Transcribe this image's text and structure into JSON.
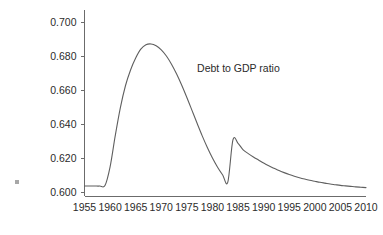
{
  "chart_data": {
    "type": "line",
    "title": "",
    "subtitle": "",
    "xlabel": "",
    "ylabel": "",
    "xlim": [
      1955,
      2010
    ],
    "ylim": [
      0.6,
      0.7
    ],
    "grid": false,
    "legend_position": "none",
    "annotations": [
      {
        "text": "Debt to GDP ratio",
        "x": 1977,
        "y": 0.6705
      }
    ],
    "x_tick_labels": [
      "1955",
      "1960",
      "1965",
      "1970",
      "1975",
      "1980",
      "1985",
      "1990",
      "1995",
      "2000",
      "2005",
      "2010"
    ],
    "x_ticks": [
      1955,
      1960,
      1965,
      1970,
      1975,
      1980,
      1985,
      1990,
      1995,
      2000,
      2005,
      2010
    ],
    "y_tick_labels": [
      "0.600",
      "0.620",
      "0.640",
      "0.660",
      "0.680",
      "0.700"
    ],
    "y_ticks": [
      0.6,
      0.62,
      0.64,
      0.66,
      0.68,
      0.7
    ],
    "series": [
      {
        "name": "Debt to GDP ratio",
        "color": "#5f5f5f",
        "x": [
          1955,
          1956,
          1957,
          1958,
          1959,
          1960,
          1961,
          1962,
          1963,
          1964,
          1965,
          1966,
          1967,
          1968,
          1969,
          1970,
          1971,
          1972,
          1973,
          1974,
          1975,
          1976,
          1977,
          1978,
          1979,
          1980,
          1981,
          1982,
          1983,
          1984,
          1985,
          1986,
          1987,
          1988,
          1989,
          1990,
          1991,
          1992,
          1993,
          1994,
          1995,
          1996,
          1997,
          1998,
          1999,
          2000,
          2001,
          2002,
          2003,
          2004,
          2005,
          2006,
          2007,
          2008,
          2009,
          2010
        ],
        "y": [
          0.6035,
          0.6035,
          0.6035,
          0.6035,
          0.6038,
          0.6148,
          0.633,
          0.6495,
          0.6625,
          0.6718,
          0.6788,
          0.684,
          0.6866,
          0.6871,
          0.686,
          0.6836,
          0.68,
          0.6752,
          0.6694,
          0.6628,
          0.6556,
          0.648,
          0.6404,
          0.633,
          0.6262,
          0.62,
          0.6146,
          0.61,
          0.6058,
          0.6306,
          0.6286,
          0.6248,
          0.6226,
          0.6206,
          0.6188,
          0.617,
          0.6154,
          0.614,
          0.6126,
          0.6114,
          0.6103,
          0.6093,
          0.6084,
          0.6076,
          0.6069,
          0.6063,
          0.6057,
          0.6052,
          0.6047,
          0.6043,
          0.6039,
          0.6036,
          0.6033,
          0.603,
          0.6028,
          0.6026
        ]
      }
    ]
  }
}
